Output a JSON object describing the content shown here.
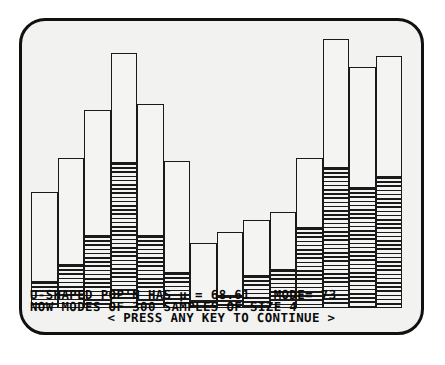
{
  "display": {
    "kind": "crt-monochrome-terminal",
    "background_color": "#f2f2f0",
    "ink_color": "#111111"
  },
  "console": {
    "line1": "U-SHAPED POP'N HAS µ = 68.61   MODE= 73",
    "line2": "NOW MODES OF 300 SAMPLES OF SIZE 4",
    "line3": "< PRESS ANY KEY TO CONTINUE >"
  },
  "statistics": {
    "population_shape": "U-SHAPED",
    "mu_label": "µ",
    "mu_value": "68.61",
    "mode_label": "MODE=",
    "mode_value": "73",
    "sample_count": "300",
    "sample_size": "4",
    "statistic": "MODES"
  },
  "chart_data": {
    "type": "bar",
    "title": "U-SHAPED POP'N HAS µ = 68.61   MODE= 73",
    "subtitle": "NOW MODES OF 300 SAMPLES OF SIZE 4",
    "xlabel": "",
    "ylabel": "",
    "grid": false,
    "legend": "none",
    "ylim": [
      0,
      100
    ],
    "categories": [
      "1",
      "2",
      "3",
      "4",
      "5",
      "6",
      "7",
      "8",
      "9",
      "10",
      "11",
      "12",
      "13",
      "14"
    ],
    "series": [
      {
        "name": "total",
        "values": [
          41,
          53,
          70,
          90,
          72,
          52,
          23,
          27,
          31,
          34,
          53,
          95,
          85,
          89
        ]
      },
      {
        "name": "shaded",
        "values": [
          9,
          15,
          25,
          51,
          25,
          12,
          2,
          4,
          11,
          13,
          28,
          49,
          42,
          46
        ]
      }
    ]
  },
  "bars": [
    {
      "index": 1,
      "x": 0,
      "width": 26.5,
      "height": 41,
      "shaded": 9
    },
    {
      "index": 2,
      "x": 26.5,
      "width": 26.5,
      "height": 53,
      "shaded": 15
    },
    {
      "index": 3,
      "x": 53,
      "width": 26.5,
      "height": 70,
      "shaded": 25
    },
    {
      "index": 4,
      "x": 79.5,
      "width": 26.5,
      "height": 90,
      "shaded": 51
    },
    {
      "index": 5,
      "x": 106,
      "width": 26.5,
      "height": 72,
      "shaded": 25
    },
    {
      "index": 6,
      "x": 132.5,
      "width": 26.5,
      "height": 52,
      "shaded": 12
    },
    {
      "index": 7,
      "x": 159,
      "width": 26.5,
      "height": 23,
      "shaded": 2
    },
    {
      "index": 8,
      "x": 185.5,
      "width": 26.5,
      "height": 27,
      "shaded": 4
    },
    {
      "index": 9,
      "x": 212,
      "width": 26.5,
      "height": 31,
      "shaded": 11
    },
    {
      "index": 10,
      "x": 238.5,
      "width": 26.5,
      "height": 34,
      "shaded": 13
    },
    {
      "index": 11,
      "x": 265,
      "width": 26.5,
      "height": 53,
      "shaded": 28
    },
    {
      "index": 12,
      "x": 291.5,
      "width": 26.5,
      "height": 95,
      "shaded": 49
    },
    {
      "index": 13,
      "x": 318,
      "width": 26.5,
      "height": 85,
      "shaded": 42
    },
    {
      "index": 14,
      "x": 344.5,
      "width": 26.5,
      "height": 89,
      "shaded": 46
    }
  ]
}
